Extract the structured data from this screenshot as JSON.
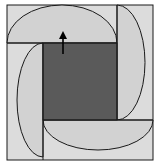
{
  "diagram": {
    "colors": {
      "background": "#ffffff",
      "outer_fill": "#dcdcdc",
      "semicircle_fill": "#d0d0d0",
      "inner_square_fill": "#5a5a5a",
      "stroke": "#1a1a1a",
      "arrow": "#000000"
    },
    "outer_square": {
      "x": 7,
      "y": 5,
      "w": 146,
      "h": 155
    },
    "inner_square": {
      "x": 43,
      "y": 43,
      "w": 74,
      "h": 77
    },
    "semicircles": [
      {
        "name": "top",
        "from": [
          7,
          43
        ],
        "to": [
          117,
          43
        ]
      },
      {
        "name": "right",
        "from": [
          117,
          5
        ],
        "to": [
          117,
          120
        ]
      },
      {
        "name": "bottom",
        "from": [
          153,
          120
        ],
        "to": [
          43,
          120
        ]
      },
      {
        "name": "left",
        "from": [
          43,
          157
        ],
        "to": [
          43,
          43
        ]
      }
    ],
    "arrow": {
      "from": [
        63,
        54
      ],
      "to": [
        63,
        32
      ],
      "direction": "up"
    }
  }
}
